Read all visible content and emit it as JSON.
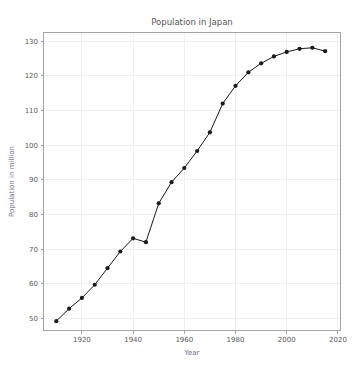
{
  "chart_data": {
    "type": "line",
    "title": "Population in Japan",
    "xlabel": "Year",
    "ylabel": "Population in million",
    "xlim": [
      1905,
      2021
    ],
    "ylim": [
      46.5,
      132.5
    ],
    "xticks": [
      1920,
      1940,
      1960,
      1980,
      2000,
      2020
    ],
    "yticks": [
      50,
      60,
      70,
      80,
      90,
      100,
      110,
      120,
      130
    ],
    "xtick_labels": [
      "1920",
      "1940",
      "1960",
      "1980",
      "2000",
      "2020"
    ],
    "ytick_labels": [
      "50",
      "60",
      "70",
      "80",
      "90",
      "100",
      "110",
      "120",
      "130"
    ],
    "grid": true,
    "legend": "none",
    "marker": "circle",
    "line_color": "#1a1a1a",
    "marker_color": "#1a1a1a",
    "grid_color": "#eaeaf2",
    "series": [
      {
        "name": "Population in million",
        "x": [
          1910,
          1915,
          1920,
          1925,
          1930,
          1935,
          1940,
          1945,
          1950,
          1955,
          1960,
          1965,
          1970,
          1975,
          1980,
          1985,
          1990,
          1995,
          2000,
          2005,
          2010,
          2015
        ],
        "values": [
          49.2,
          52.8,
          55.9,
          59.7,
          64.5,
          69.3,
          73.1,
          72.0,
          83.2,
          89.3,
          93.4,
          98.3,
          103.7,
          112.0,
          117.1,
          121.0,
          123.6,
          125.6,
          126.9,
          127.8,
          128.1,
          127.1
        ]
      }
    ]
  },
  "figure": {
    "background_color": "#ffffff",
    "plot_background_color": "#ffffff"
  }
}
